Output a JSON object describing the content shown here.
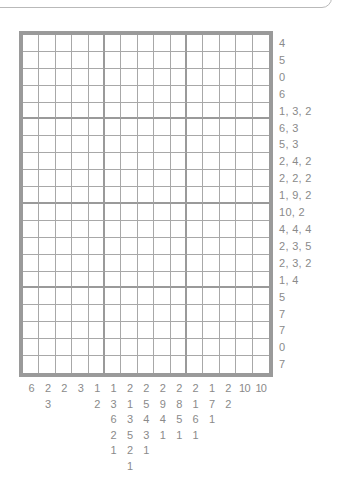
{
  "puzzle": {
    "type": "nonogram",
    "columns": 15,
    "rows": 20,
    "row_clues": [
      "4",
      "5",
      "0",
      "6",
      "1, 3, 2",
      "6, 3",
      "5, 3",
      "2, 4, 2",
      "2, 2, 2",
      "1, 9, 2",
      "10, 2",
      "4, 4, 4",
      "2, 3, 5",
      "2, 3, 2",
      "1, 4",
      "5",
      "7",
      "7",
      "0",
      "7"
    ],
    "col_clues": [
      [
        "6"
      ],
      [
        "2",
        "3"
      ],
      [
        "2"
      ],
      [
        "3"
      ],
      [
        "1",
        "2"
      ],
      [
        "1",
        "3",
        "6",
        "2",
        "1"
      ],
      [
        "2",
        "1",
        "3",
        "5",
        "2",
        "1"
      ],
      [
        "2",
        "5",
        "4",
        "3",
        "1"
      ],
      [
        "2",
        "9",
        "4",
        "1"
      ],
      [
        "2",
        "8",
        "5",
        "1"
      ],
      [
        "2",
        "1",
        "6",
        "1"
      ],
      [
        "1",
        "7",
        "1"
      ],
      [
        "2",
        "2"
      ],
      [
        "10"
      ],
      [
        "10"
      ]
    ]
  },
  "colors": {
    "border": "#9a9a9a",
    "grid_line": "#a8a8a8",
    "clue_text": "#8a8a8a",
    "cell_empty": "#ffffff"
  }
}
